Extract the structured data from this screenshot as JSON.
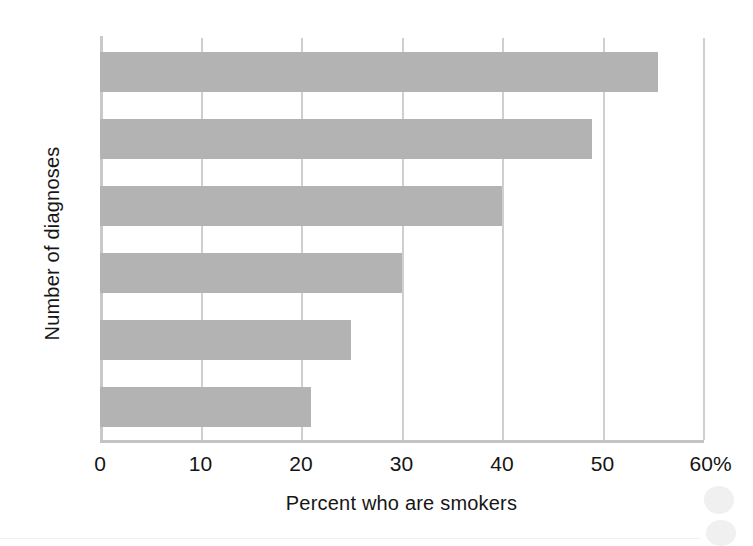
{
  "chart_data": {
    "type": "bar",
    "orientation": "horizontal",
    "title": "",
    "xlabel": "Percent who are smokers",
    "ylabel": "Number of diagnoses",
    "categories": [
      "0",
      "1",
      "2",
      "3",
      "4",
      ">4"
    ],
    "values": [
      21,
      25,
      30,
      40,
      49,
      55.5
    ],
    "series": [
      {
        "name": "Percent who are smokers",
        "values": [
          21,
          25,
          30,
          40,
          49,
          55.5
        ]
      }
    ],
    "xlim": [
      0,
      60
    ],
    "ylim_categories": [
      "0",
      "1",
      "2",
      "3",
      "4",
      ">4"
    ],
    "xticks": [
      0,
      10,
      20,
      30,
      40,
      50,
      60
    ],
    "xtick_labels": [
      "0",
      "10",
      "20",
      "30",
      "40",
      "50",
      "60%"
    ],
    "grid": true,
    "grid_axis": "x",
    "legend": false,
    "bar_color": "#b3b3b3",
    "gridline_color": "#cfcfcf",
    "axis_color": "#c9c9c9",
    "background_color": "#ffffff"
  },
  "figure": {
    "y_axis_title": "Number of diagnoses",
    "x_axis_title": "Percent who are smokers",
    "x_tick_labels": [
      "0",
      "10",
      "20",
      "30",
      "40",
      "50",
      "60%"
    ],
    "y_tick_labels": [
      ">4",
      "4",
      "3",
      "2",
      "1",
      "0"
    ],
    "bars": [
      {
        "category": ">4",
        "value": 55.5,
        "label": ">4"
      },
      {
        "category": "4",
        "value": 49,
        "label": "4"
      },
      {
        "category": "3",
        "value": 40,
        "label": "3"
      },
      {
        "category": "2",
        "value": 30,
        "label": "2"
      },
      {
        "category": "1",
        "value": 25,
        "label": "1"
      },
      {
        "category": "0",
        "value": 21,
        "label": "0"
      }
    ]
  }
}
